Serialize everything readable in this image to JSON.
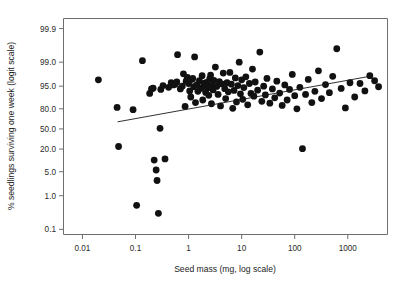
{
  "chart_data": {
    "type": "scatter",
    "title": "",
    "xlabel": "Seed mass (mg, log scale)",
    "ylabel": "% seedlings surviving one week (logit scale)",
    "x_scale": "log10",
    "y_scale": "logit",
    "xlim": [
      0.0044,
      5600
    ],
    "ylim": [
      0.07,
      99.95
    ],
    "grid": false,
    "legend": null,
    "x_ticks": [
      {
        "value": 0.01,
        "label": "0.01"
      },
      {
        "value": 0.1,
        "label": "0.1"
      },
      {
        "value": 1,
        "label": "1"
      },
      {
        "value": 10,
        "label": "10"
      },
      {
        "value": 100,
        "label": "100"
      },
      {
        "value": 1000,
        "label": "1000"
      }
    ],
    "y_ticks": [
      {
        "value": 99.9,
        "label": "99.9"
      },
      {
        "value": 99.0,
        "label": "99.0"
      },
      {
        "value": 95.0,
        "label": "95.0"
      },
      {
        "value": 80.0,
        "label": "80.0"
      },
      {
        "value": 50.0,
        "label": "50.0"
      },
      {
        "value": 20.0,
        "label": "20.0"
      },
      {
        "value": 5.0,
        "label": "5.0"
      },
      {
        "value": 1.0,
        "label": "1.0"
      },
      {
        "value": 0.1,
        "label": "0.1"
      }
    ],
    "marker": {
      "shape": "circle",
      "radius_px": 3.4,
      "color": "#111111"
    },
    "trend_line": {
      "visible": true,
      "color": "#1a1a1a",
      "x_start": 0.046,
      "y_start": 62.0,
      "x_end": 2600,
      "y_end": 97.4
    },
    "points": [
      {
        "x": 0.02,
        "y": 96.7
      },
      {
        "x": 0.045,
        "y": 81.5
      },
      {
        "x": 0.048,
        "y": 23.0
      },
      {
        "x": 0.09,
        "y": 79.0
      },
      {
        "x": 0.105,
        "y": 0.52
      },
      {
        "x": 0.135,
        "y": 99.1
      },
      {
        "x": 0.185,
        "y": 92.0
      },
      {
        "x": 0.2,
        "y": 94.0
      },
      {
        "x": 0.215,
        "y": 94.3
      },
      {
        "x": 0.225,
        "y": 10.5
      },
      {
        "x": 0.245,
        "y": 5.6
      },
      {
        "x": 0.255,
        "y": 2.8
      },
      {
        "x": 0.27,
        "y": 0.3
      },
      {
        "x": 0.29,
        "y": 51.0
      },
      {
        "x": 0.3,
        "y": 93.8
      },
      {
        "x": 0.33,
        "y": 95.2
      },
      {
        "x": 0.36,
        "y": 11.3
      },
      {
        "x": 0.42,
        "y": 94.6
      },
      {
        "x": 0.47,
        "y": 96.0
      },
      {
        "x": 0.52,
        "y": 95.4
      },
      {
        "x": 0.56,
        "y": 95.6
      },
      {
        "x": 0.6,
        "y": 96.2
      },
      {
        "x": 0.62,
        "y": 99.4
      },
      {
        "x": 0.7,
        "y": 94.0
      },
      {
        "x": 0.76,
        "y": 95.0
      },
      {
        "x": 0.8,
        "y": 97.8
      },
      {
        "x": 0.86,
        "y": 82.5
      },
      {
        "x": 0.9,
        "y": 96.4
      },
      {
        "x": 0.95,
        "y": 97.2
      },
      {
        "x": 1.0,
        "y": 95.8
      },
      {
        "x": 1.05,
        "y": 93.2
      },
      {
        "x": 1.1,
        "y": 90.0
      },
      {
        "x": 1.15,
        "y": 96.8
      },
      {
        "x": 1.2,
        "y": 97.0
      },
      {
        "x": 1.25,
        "y": 94.8
      },
      {
        "x": 1.3,
        "y": 99.3
      },
      {
        "x": 1.35,
        "y": 86.0
      },
      {
        "x": 1.45,
        "y": 95.5
      },
      {
        "x": 1.5,
        "y": 93.0
      },
      {
        "x": 1.6,
        "y": 96.5
      },
      {
        "x": 1.7,
        "y": 94.2
      },
      {
        "x": 1.8,
        "y": 97.5
      },
      {
        "x": 1.85,
        "y": 88.0
      },
      {
        "x": 1.95,
        "y": 95.1
      },
      {
        "x": 2.0,
        "y": 95.9
      },
      {
        "x": 2.1,
        "y": 92.5
      },
      {
        "x": 2.2,
        "y": 96.1
      },
      {
        "x": 2.3,
        "y": 94.4
      },
      {
        "x": 2.4,
        "y": 91.0
      },
      {
        "x": 2.5,
        "y": 96.9
      },
      {
        "x": 2.6,
        "y": 97.6
      },
      {
        "x": 2.7,
        "y": 85.0
      },
      {
        "x": 2.8,
        "y": 95.3
      },
      {
        "x": 2.9,
        "y": 93.6
      },
      {
        "x": 3.0,
        "y": 96.6
      },
      {
        "x": 3.2,
        "y": 98.6
      },
      {
        "x": 3.4,
        "y": 94.9
      },
      {
        "x": 3.6,
        "y": 91.5
      },
      {
        "x": 3.8,
        "y": 96.3
      },
      {
        "x": 4.0,
        "y": 83.0
      },
      {
        "x": 4.2,
        "y": 95.7
      },
      {
        "x": 4.5,
        "y": 97.9
      },
      {
        "x": 4.8,
        "y": 94.1
      },
      {
        "x": 5.0,
        "y": 89.0
      },
      {
        "x": 5.3,
        "y": 96.0
      },
      {
        "x": 5.6,
        "y": 92.8
      },
      {
        "x": 6.0,
        "y": 98.0
      },
      {
        "x": 6.4,
        "y": 95.6
      },
      {
        "x": 6.8,
        "y": 80.5
      },
      {
        "x": 7.2,
        "y": 93.4
      },
      {
        "x": 7.6,
        "y": 97.1
      },
      {
        "x": 8.0,
        "y": 86.5
      },
      {
        "x": 8.5,
        "y": 95.2
      },
      {
        "x": 9.0,
        "y": 99.0
      },
      {
        "x": 9.5,
        "y": 91.8
      },
      {
        "x": 10.0,
        "y": 96.7
      },
      {
        "x": 10.5,
        "y": 88.5
      },
      {
        "x": 11.0,
        "y": 94.5
      },
      {
        "x": 12.0,
        "y": 97.3
      },
      {
        "x": 13.0,
        "y": 84.0
      },
      {
        "x": 14.0,
        "y": 95.8
      },
      {
        "x": 15.0,
        "y": 92.0
      },
      {
        "x": 16.0,
        "y": 98.4
      },
      {
        "x": 17.0,
        "y": 90.5
      },
      {
        "x": 18.0,
        "y": 96.2
      },
      {
        "x": 20.0,
        "y": 93.5
      },
      {
        "x": 22.0,
        "y": 99.5
      },
      {
        "x": 24.0,
        "y": 87.0
      },
      {
        "x": 26.0,
        "y": 95.0
      },
      {
        "x": 28.0,
        "y": 91.2
      },
      {
        "x": 30.0,
        "y": 97.0
      },
      {
        "x": 34.0,
        "y": 85.5
      },
      {
        "x": 38.0,
        "y": 94.0
      },
      {
        "x": 42.0,
        "y": 89.5
      },
      {
        "x": 46.0,
        "y": 96.4
      },
      {
        "x": 52.0,
        "y": 92.2
      },
      {
        "x": 58.0,
        "y": 83.5
      },
      {
        "x": 65.0,
        "y": 95.4
      },
      {
        "x": 72.0,
        "y": 88.0
      },
      {
        "x": 80.0,
        "y": 93.8
      },
      {
        "x": 90.0,
        "y": 97.7
      },
      {
        "x": 100.0,
        "y": 90.8
      },
      {
        "x": 110.0,
        "y": 80.0
      },
      {
        "x": 125.0,
        "y": 94.6
      },
      {
        "x": 140.0,
        "y": 20.5
      },
      {
        "x": 160.0,
        "y": 91.5
      },
      {
        "x": 180.0,
        "y": 96.8
      },
      {
        "x": 210.0,
        "y": 86.0
      },
      {
        "x": 240.0,
        "y": 93.0
      },
      {
        "x": 280.0,
        "y": 98.2
      },
      {
        "x": 320.0,
        "y": 89.0
      },
      {
        "x": 380.0,
        "y": 95.5
      },
      {
        "x": 450.0,
        "y": 92.4
      },
      {
        "x": 520.0,
        "y": 97.4
      },
      {
        "x": 620.0,
        "y": 99.6
      },
      {
        "x": 750.0,
        "y": 94.2
      },
      {
        "x": 900.0,
        "y": 81.0
      },
      {
        "x": 1100.0,
        "y": 96.0
      },
      {
        "x": 1350.0,
        "y": 90.0
      },
      {
        "x": 1700.0,
        "y": 95.8
      },
      {
        "x": 2100.0,
        "y": 93.2
      },
      {
        "x": 2600.0,
        "y": 97.5
      },
      {
        "x": 3200.0,
        "y": 96.5
      },
      {
        "x": 3800.0,
        "y": 94.8
      }
    ]
  }
}
